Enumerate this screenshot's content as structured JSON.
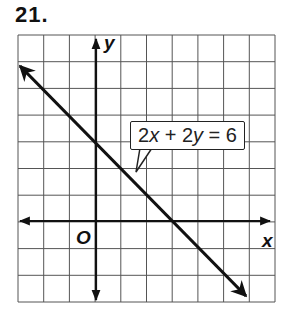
{
  "problem": {
    "number_label": "21."
  },
  "graph": {
    "x_axis_label": "x",
    "y_axis_label": "y",
    "origin_label": "O",
    "equation_label": "2x + 2y = 6",
    "equation_parts": {
      "a": "2",
      "x": "x",
      "plus": " + 2",
      "y": "y",
      "rhs": " = 6"
    },
    "grid": {
      "columns": 10,
      "rows": 10,
      "x_min": -3,
      "x_max": 7,
      "y_min": -3,
      "y_max": 7
    },
    "colors": {
      "grid": "#555555",
      "axes": "#111111",
      "line": "#111111",
      "background": "#ffffff"
    }
  },
  "chart_data": {
    "type": "line",
    "title": "21.",
    "xlabel": "x",
    "ylabel": "y",
    "xlim": [
      -3,
      7
    ],
    "ylim": [
      -3,
      7
    ],
    "grid": true,
    "series": [
      {
        "name": "2x + 2y = 6",
        "equation": "y = 3 - x",
        "x": [
          -3,
          0,
          3,
          6.8
        ],
        "y": [
          6,
          3,
          0,
          -3.8
        ],
        "arrows": "both"
      }
    ],
    "annotations": [
      {
        "text": "2x + 2y = 6",
        "type": "callout",
        "points_to": [
          1.5,
          1.5
        ]
      },
      {
        "text": "O",
        "type": "origin"
      }
    ]
  }
}
